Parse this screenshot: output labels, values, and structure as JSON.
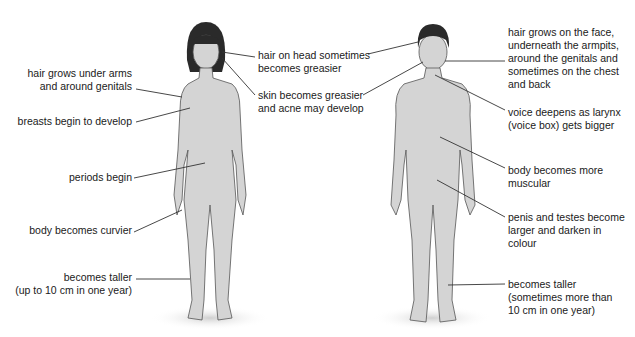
{
  "diagram": {
    "female": {
      "labels": [
        {
          "id": "hair-head",
          "text": "hair on head sometimes\nbecomes greasier"
        },
        {
          "id": "skin",
          "text": "skin becomes greasier\nand acne may develop"
        },
        {
          "id": "hair-arms",
          "text": "hair grows under arms\nand around genitals"
        },
        {
          "id": "breasts",
          "text": "breasts begin to develop"
        },
        {
          "id": "periods",
          "text": "periods begin"
        },
        {
          "id": "curvier",
          "text": "body becomes curvier"
        },
        {
          "id": "taller",
          "text": "becomes taller\n(up to 10 cm in one year)"
        }
      ]
    },
    "male": {
      "labels": [
        {
          "id": "hair-face",
          "text": "hair grows on the face,\nunderneath the armpits,\naround the genitals and\nsometimes on the chest\nand back"
        },
        {
          "id": "voice",
          "text": "voice deepens as larynx\n(voice box) gets bigger"
        },
        {
          "id": "muscular",
          "text": "body becomes more\nmuscular"
        },
        {
          "id": "penis",
          "text": "penis and testes become\nlarger and darken in\ncolour"
        },
        {
          "id": "taller",
          "text": "becomes taller\n(sometimes more than\n10 cm in one year)"
        }
      ]
    },
    "colors": {
      "skin": "#d4d4d4",
      "outline": "#555555",
      "hair": "#2a2a2a",
      "line": "#333333"
    }
  }
}
